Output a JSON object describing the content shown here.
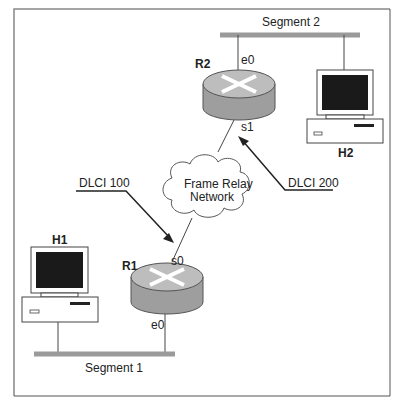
{
  "diagram": {
    "segments": [
      {
        "id": "segment-1",
        "label": "Segment 1"
      },
      {
        "id": "segment-2",
        "label": "Segment 2"
      }
    ],
    "routers": [
      {
        "id": "r1",
        "label": "R1",
        "interfaces": {
          "serial": "s0",
          "ethernet": "e0"
        }
      },
      {
        "id": "r2",
        "label": "R2",
        "interfaces": {
          "serial": "s1",
          "ethernet": "e0"
        }
      }
    ],
    "hosts": [
      {
        "id": "h1",
        "label": "H1"
      },
      {
        "id": "h2",
        "label": "H2"
      }
    ],
    "cloud": {
      "line1": "Frame Relay",
      "line2": "Network"
    },
    "dlci": [
      {
        "label": "DLCI 100",
        "points_to": "R1 s0"
      },
      {
        "label": "DLCI 200",
        "points_to": "R2 s1"
      }
    ],
    "colors": {
      "segment": "#9a9a9a",
      "router_top": "#bdbdbd",
      "router_side": "#9e9e9e",
      "screen": "#1a1a1a"
    }
  }
}
